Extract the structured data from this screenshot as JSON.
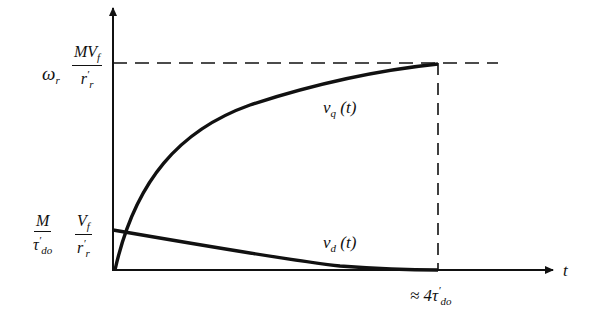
{
  "diagram": {
    "type": "time-response-plot",
    "axes": {
      "x_label": "t",
      "x_tick": "≈ 4τ'do",
      "x_tick_base": "≈ 4τ",
      "x_tick_prime": "′",
      "x_tick_sub": "do"
    },
    "y_labels": {
      "upper": {
        "prefix": "ω",
        "prefix_sub": "r",
        "num": "MV",
        "num_sub": "f",
        "den": "r",
        "den_prime": "′",
        "den_sub": "r"
      },
      "lower": {
        "frac1_num": "M",
        "frac1_den": "τ",
        "frac1_den_prime": "′",
        "frac1_den_sub": "do",
        "frac2_num": "V",
        "frac2_num_sub": "f",
        "frac2_den": "r",
        "frac2_den_prime": "′",
        "frac2_den_sub": "r"
      }
    },
    "curves": [
      {
        "name": "v_q(t)",
        "label": "v",
        "label_sub": "q",
        "label_arg": "(t)",
        "shape": "rising exponential to ω_r M V_f / r'_r"
      },
      {
        "name": "v_d(t)",
        "label": "v",
        "label_sub": "d",
        "label_arg": "(t)",
        "shape": "decaying exponential from (M/τ'_do)(V_f/r'_r) to 0"
      }
    ],
    "colors": {
      "ink": "#111111",
      "background": "#ffffff"
    }
  }
}
